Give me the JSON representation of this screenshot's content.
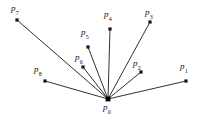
{
  "figure": {
    "kind": "star-graph-diagram",
    "caption": "",
    "background_color": "#ffffff",
    "line_color": "#1a1a1a",
    "vertex_color": "#141414",
    "width": 203,
    "height": 121,
    "hub": {
      "id": "p0",
      "base": "p",
      "subscript": "0",
      "x": 108,
      "y": 99,
      "label_x": 103,
      "label_y": 103
    },
    "spokes": [
      {
        "id": "p1",
        "base": "p",
        "subscript": "1",
        "x": 186,
        "y": 81,
        "label_x": 180,
        "label_y": 62
      },
      {
        "id": "p2",
        "base": "p",
        "subscript": "2",
        "x": 141,
        "y": 72,
        "label_x": 133,
        "label_y": 59
      },
      {
        "id": "p3",
        "base": "p",
        "subscript": "3",
        "x": 150,
        "y": 22,
        "label_x": 145,
        "label_y": 8
      },
      {
        "id": "p4",
        "base": "p",
        "subscript": "4",
        "x": 110,
        "y": 29,
        "label_x": 104,
        "label_y": 10
      },
      {
        "id": "p5",
        "base": "p",
        "subscript": "5",
        "x": 88,
        "y": 47,
        "label_x": 81,
        "label_y": 28
      },
      {
        "id": "p6",
        "base": "p",
        "subscript": "6",
        "x": 83,
        "y": 67,
        "label_x": 75,
        "label_y": 53
      },
      {
        "id": "p7",
        "base": "p",
        "subscript": "7",
        "x": 17,
        "y": 20,
        "label_x": 11,
        "label_y": 4
      },
      {
        "id": "p8",
        "base": "p",
        "subscript": "8",
        "x": 45,
        "y": 81,
        "label_x": 34,
        "label_y": 65
      }
    ]
  }
}
